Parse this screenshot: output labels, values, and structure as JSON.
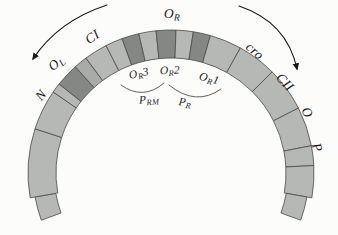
{
  "figure": {
    "background": "#fcfcfb"
  },
  "arc": {
    "colors": {
      "light": "#b6b8b5",
      "medium": "#a9aba8",
      "dark": "#848783",
      "outline": "#4a4a4a",
      "text": "#1b1b1b",
      "arrow": "#1a1a1a"
    },
    "geometry": {
      "cx": 171,
      "cy": 173,
      "r_outer": 143,
      "r_inner": 115,
      "tail_r_outer": 138,
      "tail_r_inner": 117
    },
    "segments": [
      {
        "name": "left-tail",
        "from": -110,
        "to": -100,
        "shade": "light",
        "tail": true
      },
      {
        "name": "segment-n-lower",
        "from": -100,
        "to": -72,
        "shade": "light"
      },
      {
        "name": "segment-n-upper",
        "from": -72,
        "to": -55.5,
        "shade": "light"
      },
      {
        "name": "segment-ol-flank-left",
        "from": -55.5,
        "to": -51.5,
        "shade": "light"
      },
      {
        "name": "segment-ol-operator",
        "from": -51.5,
        "to": -42,
        "shade": "dark"
      },
      {
        "name": "segment-ol-flank-right",
        "from": -42,
        "to": -36.5,
        "shade": "medium"
      },
      {
        "name": "segment-ci",
        "from": -36.5,
        "to": -27,
        "shade": "light"
      },
      {
        "name": "segment-or3-flank",
        "from": -27,
        "to": -20,
        "shade": "light"
      },
      {
        "name": "segment-or3-operator",
        "from": -20,
        "to": -13,
        "shade": "dark"
      },
      {
        "name": "segment-or-spacer-1",
        "from": -13,
        "to": -6,
        "shade": "light"
      },
      {
        "name": "segment-or2-operator",
        "from": -6,
        "to": 2,
        "shade": "dark"
      },
      {
        "name": "segment-or-spacer-2",
        "from": 2,
        "to": 9,
        "shade": "light"
      },
      {
        "name": "segment-or1-operator",
        "from": 9,
        "to": 16,
        "shade": "dark"
      },
      {
        "name": "segment-cro",
        "from": 16,
        "to": 29,
        "shade": "light"
      },
      {
        "name": "segment-cii",
        "from": 29,
        "to": 45,
        "shade": "light"
      },
      {
        "name": "segment-o",
        "from": 45,
        "to": 63,
        "shade": "light"
      },
      {
        "name": "segment-p",
        "from": 63,
        "to": 79,
        "shade": "light"
      },
      {
        "name": "segment-p-lower",
        "from": 79,
        "to": 87,
        "shade": "light"
      },
      {
        "name": "segment-right-end",
        "from": 87,
        "to": 100,
        "shade": "light"
      },
      {
        "name": "right-tail",
        "from": 100,
        "to": 110,
        "shade": "light",
        "tail": true
      }
    ]
  },
  "labels": [
    {
      "name": "label-gene-n",
      "parts": [
        {
          "t": "N"
        }
      ],
      "x": 42,
      "y": 96,
      "rot": -50,
      "size": 13.5
    },
    {
      "name": "label-operator-ol",
      "parts": [
        {
          "t": "O"
        },
        {
          "t": "L",
          "sub": true
        }
      ],
      "x": 57,
      "y": 64,
      "rot": -40,
      "size": 13.5
    },
    {
      "name": "label-gene-ci",
      "parts": [
        {
          "t": "CI"
        }
      ],
      "x": 93,
      "y": 38,
      "rot": -33,
      "size": 13.5
    },
    {
      "name": "label-operator-or",
      "parts": [
        {
          "t": "O"
        },
        {
          "t": "R",
          "sub": true
        }
      ],
      "x": 172,
      "y": 15,
      "rot": 2,
      "size": 13.5
    },
    {
      "name": "label-gene-cro",
      "parts": [
        {
          "t": "cro"
        }
      ],
      "x": 254,
      "y": 52,
      "rot": 40,
      "size": 13.5
    },
    {
      "name": "label-gene-cii",
      "parts": [
        {
          "t": "CII"
        }
      ],
      "x": 284,
      "y": 83,
      "rot": 46,
      "size": 13.5
    },
    {
      "name": "label-gene-o",
      "parts": [
        {
          "t": "O"
        }
      ],
      "x": 306,
      "y": 113,
      "rot": 62,
      "size": 13.5
    },
    {
      "name": "label-gene-p",
      "parts": [
        {
          "t": "P"
        }
      ],
      "x": 316,
      "y": 148,
      "rot": 72,
      "size": 13.5
    },
    {
      "name": "label-site-or3",
      "parts": [
        {
          "t": "O"
        },
        {
          "t": "R",
          "sub": true
        },
        {
          "t": "3"
        }
      ],
      "x": 139,
      "y": 74,
      "rot": -12,
      "size": 11.5
    },
    {
      "name": "label-site-or2",
      "parts": [
        {
          "t": "O"
        },
        {
          "t": "R",
          "sub": true
        },
        {
          "t": "2"
        }
      ],
      "x": 170,
      "y": 71,
      "rot": -2,
      "size": 11.5
    },
    {
      "name": "label-site-or1",
      "parts": [
        {
          "t": "O"
        },
        {
          "t": "R",
          "sub": true
        },
        {
          "t": "1"
        }
      ],
      "x": 209,
      "y": 79,
      "rot": 14,
      "size": 11.5
    },
    {
      "name": "label-promoter-prm",
      "parts": [
        {
          "t": "P"
        },
        {
          "t": "RM",
          "sub": true
        }
      ],
      "x": 149,
      "y": 100,
      "rot": -4,
      "size": 11.5
    },
    {
      "name": "label-promoter-pr",
      "parts": [
        {
          "t": "P"
        },
        {
          "t": "R",
          "sub": true
        }
      ],
      "x": 185,
      "y": 103,
      "rot": 8,
      "size": 11.5
    }
  ],
  "brackets": [
    {
      "name": "prm-extent-bracket",
      "path": "M 121 85 Q 143 101 164 83"
    },
    {
      "name": "pr-extent-bracket",
      "path": "M 169 85 Q 196 107 221 89"
    }
  ],
  "arrows": [
    {
      "name": "leftward-transcription-arrow",
      "path": "M 107 5 Q 58 21 33 59"
    },
    {
      "name": "rightward-transcription-arrow",
      "path": "M 239 6 Q 287 22 297 69"
    }
  ]
}
